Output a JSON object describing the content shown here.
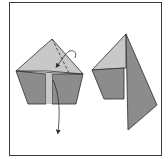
{
  "diagram": {
    "type": "origami-fold-step",
    "colors": {
      "frame": "#3a3a3a",
      "paper_light": "#c8c8c8",
      "paper_dark": "#8c8c8c",
      "line": "#2e2e2e",
      "background": "#ffffff"
    },
    "left_figure": {
      "description": "pentagon-shaped folded paper with valley fold (dashed) and fold arrows",
      "fold_line": "dashed",
      "arrows": [
        "curved-fold-arrow",
        "pull-down-arrow"
      ]
    },
    "right_figure": {
      "description": "result: triangular flap folded to the right"
    }
  }
}
